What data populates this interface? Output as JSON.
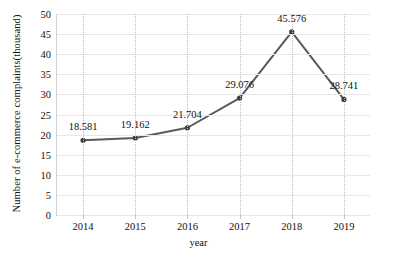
{
  "chart_data": {
    "type": "line",
    "title": "",
    "xlabel": "year",
    "ylabel": "Number of e-commerce complaints(thousand)",
    "categories": [
      "2014",
      "2015",
      "2016",
      "2017",
      "2018",
      "2019"
    ],
    "values": [
      18.581,
      19.162,
      21.704,
      29.076,
      45.576,
      28.741
    ],
    "data_labels": [
      "18.581",
      "19.162",
      "21.704",
      "29.076",
      "45.576",
      "28.741"
    ],
    "ylim": [
      0,
      50
    ],
    "ytick_labels": [
      "0",
      "5",
      "10",
      "15",
      "20",
      "25",
      "30",
      "35",
      "40",
      "45",
      "50"
    ],
    "ytick_values": [
      0,
      5,
      10,
      15,
      20,
      25,
      30,
      35,
      40,
      45,
      50
    ],
    "grid": {
      "horizontal": true,
      "vertical_dotted": true
    },
    "legend": {
      "visible": false,
      "position": "none"
    },
    "series_name": "Number of e-commerce complaints(thousand)",
    "line_color": "#59595b",
    "marker_color": "#3f3f41",
    "gridline_color": "#e8e8e8",
    "axis_color": "#cfcfcf",
    "background_color": "#ffffff"
  }
}
